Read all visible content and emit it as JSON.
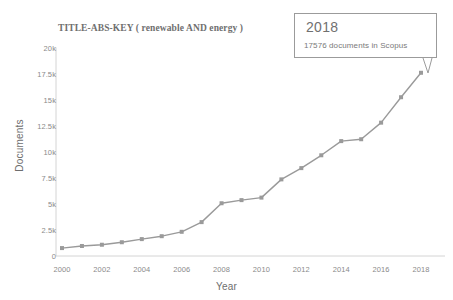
{
  "chart_data": {
    "type": "line",
    "title": "TITLE-ABS-KEY ( renewable  AND energy )",
    "xlabel": "Year",
    "ylabel": "Documents",
    "xlim": [
      2000,
      2018
    ],
    "ylim": [
      0,
      20000
    ],
    "grid": false,
    "legend": "none",
    "x_tick_labels": [
      "2000",
      "2002",
      "2004",
      "2006",
      "2008",
      "2010",
      "2012",
      "2014",
      "2016",
      "2018"
    ],
    "x_tick_values": [
      2000,
      2002,
      2004,
      2006,
      2008,
      2010,
      2012,
      2014,
      2016,
      2018
    ],
    "y_tick_labels": [
      "0",
      "2.5k",
      "5k",
      "7.5k",
      "10k",
      "12.5k",
      "15k",
      "17.5k",
      "20k"
    ],
    "y_tick_values": [
      0,
      2500,
      5000,
      7500,
      10000,
      12500,
      15000,
      17500,
      20000
    ],
    "x": [
      2000,
      2001,
      2002,
      2003,
      2004,
      2005,
      2006,
      2007,
      2008,
      2009,
      2010,
      2011,
      2012,
      2013,
      2014,
      2015,
      2016,
      2017,
      2018
    ],
    "values": [
      760,
      960,
      1080,
      1320,
      1620,
      1900,
      2320,
      3250,
      5060,
      5360,
      5600,
      7350,
      8430,
      9660,
      11020,
      11200,
      12790,
      15230,
      17576
    ],
    "series": [
      {
        "name": "Documents",
        "values": [
          760,
          960,
          1080,
          1320,
          1620,
          1900,
          2320,
          3250,
          5060,
          5360,
          5600,
          7350,
          8430,
          9660,
          11020,
          11200,
          12790,
          15230,
          17576
        ]
      }
    ],
    "marker": "square",
    "line_color": "#9a9a9a",
    "annotations": [
      {
        "type": "tooltip",
        "at_x": 2018,
        "at_y": 17576,
        "title": "2018",
        "text": "17576 documents in Scopus"
      }
    ]
  },
  "tooltip": {
    "year": "2018",
    "detail": "17576 documents in Scopus"
  },
  "axes": {
    "x_title": "Year",
    "y_title": "Documents"
  }
}
